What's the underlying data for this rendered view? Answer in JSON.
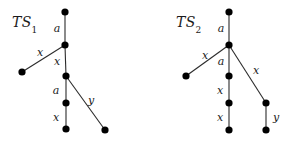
{
  "canvas": {
    "width": 289,
    "height": 145,
    "background": "#ffffff",
    "ink": "#1a1a1a",
    "edge_color": "#2b2b2b",
    "node_color": "#000000"
  },
  "figure": {
    "type": "tree-diagram-pair"
  },
  "diagrams": [
    {
      "id": "TS1",
      "title_main": "TS",
      "title_sub": "1",
      "title_x": 12,
      "title_y": 14,
      "nodes": [
        {
          "name": "root",
          "x": 65,
          "y": 12,
          "r": 3.6
        },
        {
          "name": "junction-1",
          "x": 65,
          "y": 45,
          "r": 3.6
        },
        {
          "name": "leaf-left",
          "x": 22,
          "y": 72,
          "r": 3.6
        },
        {
          "name": "junction-2",
          "x": 66,
          "y": 76,
          "r": 3.6
        },
        {
          "name": "mid-node",
          "x": 66,
          "y": 103,
          "r": 3.6
        },
        {
          "name": "leaf-bottom",
          "x": 66,
          "y": 129,
          "r": 3.6
        },
        {
          "name": "leaf-right",
          "x": 105,
          "y": 130,
          "r": 3.6
        }
      ],
      "edges": [
        {
          "name": "edge-a-root",
          "from": "root",
          "to": "junction-1",
          "label": "a",
          "label_x": 57,
          "label_y": 28
        },
        {
          "name": "edge-x-left",
          "from": "junction-1",
          "to": "leaf-left",
          "label": "x",
          "label_x": 40,
          "label_y": 52
        },
        {
          "name": "edge-x-trunk-1",
          "from": "junction-1",
          "to": "junction-2",
          "label": "x",
          "label_x": 57,
          "label_y": 61
        },
        {
          "name": "edge-a-trunk-2",
          "from": "junction-2",
          "to": "mid-node",
          "label": "a",
          "label_x": 56,
          "label_y": 90
        },
        {
          "name": "edge-x-trunk-3",
          "from": "mid-node",
          "to": "leaf-bottom",
          "label": "x",
          "label_x": 56,
          "label_y": 117
        },
        {
          "name": "edge-y-right",
          "from": "junction-2",
          "to": "leaf-right",
          "label": "y",
          "label_x": 91,
          "label_y": 100
        }
      ]
    },
    {
      "id": "TS2",
      "title_main": "TS",
      "title_sub": "2",
      "title_x": 176,
      "title_y": 14,
      "nodes": [
        {
          "name": "root",
          "x": 229,
          "y": 12,
          "r": 3.6
        },
        {
          "name": "junction-1",
          "x": 229,
          "y": 45,
          "r": 3.6
        },
        {
          "name": "leaf-left",
          "x": 186,
          "y": 76,
          "r": 3.6
        },
        {
          "name": "mid-node-1",
          "x": 229,
          "y": 76,
          "r": 3.6
        },
        {
          "name": "mid-node-2",
          "x": 229,
          "y": 103,
          "r": 3.6
        },
        {
          "name": "leaf-bottom",
          "x": 229,
          "y": 130,
          "r": 3.6
        },
        {
          "name": "right-node",
          "x": 266,
          "y": 103,
          "r": 3.6
        },
        {
          "name": "leaf-right",
          "x": 266,
          "y": 130,
          "r": 3.6
        }
      ],
      "edges": [
        {
          "name": "edge-a-root",
          "from": "root",
          "to": "junction-1",
          "label": "a",
          "label_x": 221,
          "label_y": 28
        },
        {
          "name": "edge-x-left",
          "from": "junction-1",
          "to": "leaf-left",
          "label": "x",
          "label_x": 205,
          "label_y": 55
        },
        {
          "name": "edge-a-trunk",
          "from": "junction-1",
          "to": "mid-node-1",
          "label": "a",
          "label_x": 221,
          "label_y": 61
        },
        {
          "name": "edge-x-trunk-1",
          "from": "mid-node-1",
          "to": "mid-node-2",
          "label": "x",
          "label_x": 220,
          "label_y": 90
        },
        {
          "name": "edge-x-trunk-2",
          "from": "mid-node-2",
          "to": "leaf-bottom",
          "label": "x",
          "label_x": 220,
          "label_y": 117
        },
        {
          "name": "edge-x-right",
          "from": "junction-1",
          "to": "right-node",
          "label": "x",
          "label_x": 256,
          "label_y": 70
        },
        {
          "name": "edge-y-right",
          "from": "right-node",
          "to": "leaf-right",
          "label": "y",
          "label_x": 276,
          "label_y": 117
        }
      ]
    }
  ]
}
